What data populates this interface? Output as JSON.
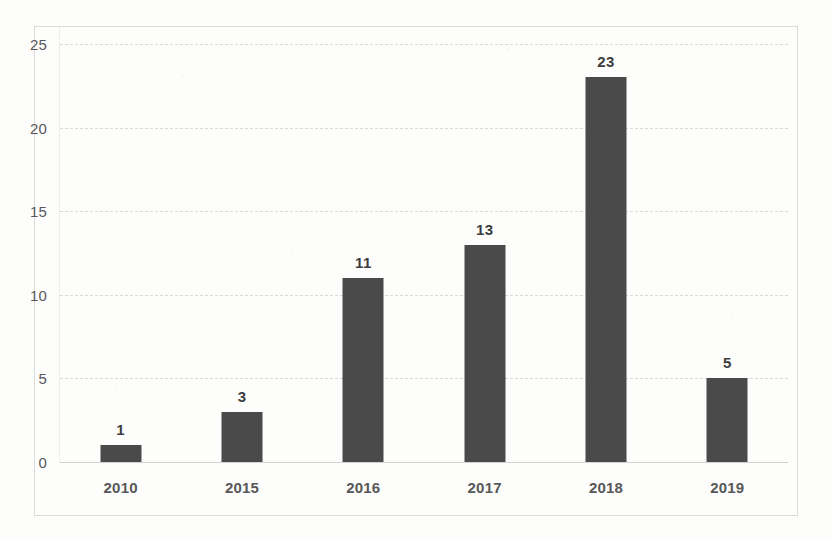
{
  "chart_data": {
    "type": "bar",
    "title": "",
    "subtitle": "",
    "xlabel": "",
    "ylabel": "",
    "categories": [
      "2010",
      "2015",
      "2016",
      "2017",
      "2018",
      "2019"
    ],
    "values": [
      1,
      3,
      11,
      13,
      23,
      5
    ],
    "data_labels": [
      "1",
      "3",
      "11",
      "13",
      "23",
      "5"
    ],
    "ylim": [
      0,
      25
    ],
    "ytick_labels": [
      "0",
      "5",
      "10",
      "15",
      "20",
      "25"
    ],
    "ytick_values": [
      0,
      5,
      10,
      15,
      20,
      25
    ],
    "grid": "horizontal-dashed",
    "legend": "none",
    "series": [
      {
        "name": "",
        "values": [
          1,
          3,
          11,
          13,
          23,
          5
        ]
      }
    ],
    "bar_color": "#4a4a4a",
    "gridline_color": "#d9d9d9",
    "axis_text_color": "#59595b",
    "plot_background": "#ffffff",
    "frame_border_color": "#dcdcdc"
  }
}
